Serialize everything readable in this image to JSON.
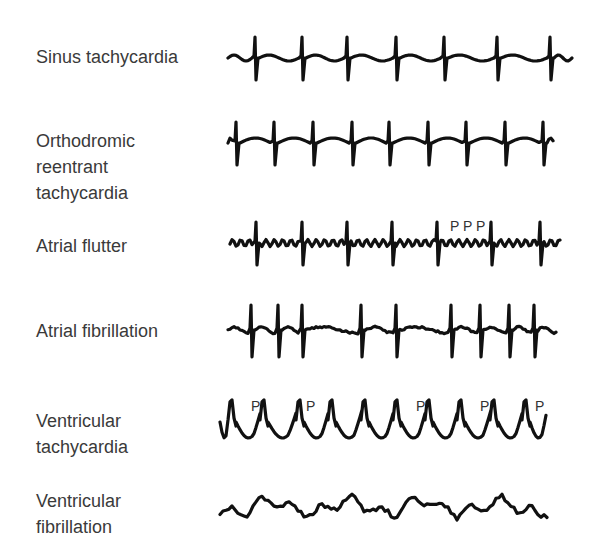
{
  "figure": {
    "rows": [
      {
        "id": "sinus",
        "label": "Sinus tachycardia",
        "label_top": 44,
        "baseline": 58,
        "x_start": 228,
        "x_end": 574,
        "qrs_x": [
          255,
          302,
          347,
          396,
          444,
          497,
          550
        ],
        "style": "sinus",
        "markers": []
      },
      {
        "id": "ort",
        "label": "Orthodromic\nreentrant\ntachycardia",
        "label_top": 128,
        "baseline": 143,
        "x_start": 228,
        "x_end": 556,
        "qrs_x": [
          236,
          274,
          313,
          352,
          389,
          428,
          466,
          505,
          543
        ],
        "style": "ort",
        "markers": []
      },
      {
        "id": "flutter",
        "label": "Atrial flutter",
        "label_top": 233,
        "baseline": 243,
        "x_start": 230,
        "x_end": 563,
        "qrs_x": [
          256,
          302,
          347,
          392,
          437,
          491,
          540
        ],
        "style": "flutter",
        "markers": [
          {
            "text": "P",
            "x": 450,
            "y": 231
          },
          {
            "text": "P",
            "x": 463,
            "y": 231
          },
          {
            "text": "P",
            "x": 476,
            "y": 231
          }
        ]
      },
      {
        "id": "afib",
        "label": "Atrial fibrillation",
        "label_top": 318,
        "baseline": 330,
        "x_start": 228,
        "x_end": 558,
        "qrs_x": [
          251,
          278,
          302,
          361,
          396,
          451,
          480,
          509,
          534
        ],
        "style": "afib",
        "markers": []
      },
      {
        "id": "vt",
        "label": "Ventricular\ntachycardia",
        "label_top": 408,
        "baseline": 422,
        "x_start": 220,
        "x_end": 549,
        "qrs_x": [
          232,
          264,
          300,
          332,
          365,
          397,
          429,
          461,
          494,
          526
        ],
        "style": "vt",
        "markers": [
          {
            "text": "P",
            "x": 251,
            "y": 411
          },
          {
            "text": "P",
            "x": 306,
            "y": 411
          },
          {
            "text": "P",
            "x": 416,
            "y": 411
          },
          {
            "text": "P",
            "x": 480,
            "y": 411
          },
          {
            "text": "P",
            "x": 535,
            "y": 411
          }
        ]
      },
      {
        "id": "vfib",
        "label": "Ventricular\nfibrillation",
        "label_top": 488,
        "baseline": 507,
        "x_start": 220,
        "x_end": 548,
        "qrs_x": [],
        "style": "vfib",
        "markers": []
      }
    ]
  }
}
